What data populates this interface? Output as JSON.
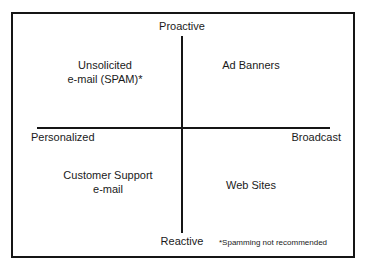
{
  "diagram": {
    "type": "2x2-matrix",
    "axes": {
      "vertical": {
        "top_label": "Proactive",
        "bottom_label": "Reactive"
      },
      "horizontal": {
        "left_label": "Personalized",
        "right_label": "Broadcast"
      }
    },
    "quadrants": {
      "upper_left": {
        "line1": "Unsolicited",
        "line2": "e-mail (SPAM)*"
      },
      "upper_right": {
        "line1": "Ad Banners"
      },
      "lower_left": {
        "line1": "Customer Support",
        "line2": "e-mail"
      },
      "lower_right": {
        "line1": "Web Sites"
      }
    },
    "footnote": "*Spamming not recommended",
    "colors": {
      "line": "#151515",
      "text": "#1a1a1a",
      "background": "#ffffff"
    }
  }
}
